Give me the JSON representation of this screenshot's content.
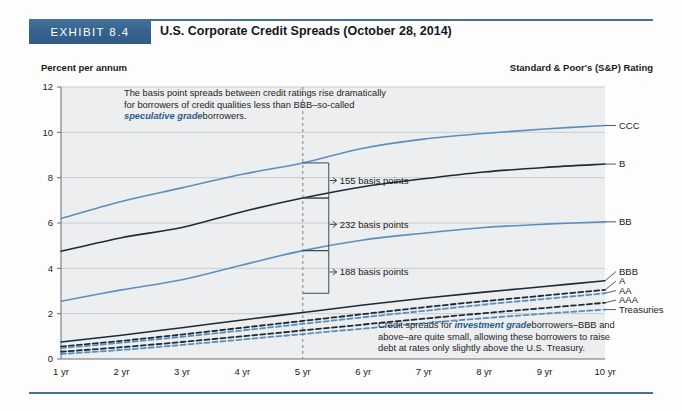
{
  "header": {
    "exhibit_badge": "EXHIBIT 8.4",
    "title": "U.S. Corporate Credit Spreads (October 28, 2014)"
  },
  "captions": {
    "left": "Percent per annum",
    "right": "Standard & Poor's (S&P) Rating"
  },
  "annotations": {
    "top": {
      "line1": "The basis point spreads between credit ratings rise dramatically",
      "line2": "for borrowers of credit qualities less than BBB–so-called",
      "emphasis": "speculative grade",
      "line3_tail": "borrowers."
    },
    "bottom": {
      "lead": "Credit spreads for",
      "emphasis": "investment grade",
      "line1_tail": "borrowers–BBB and",
      "line2": "above–are quite small, allowing these borrowers to raise",
      "line3": "debt at rates only slightly above the U.S. Treasury."
    }
  },
  "callouts": [
    {
      "id": "callout-155",
      "label": "155 basis points",
      "x_year": 5,
      "from": 7.1,
      "to": 8.65
    },
    {
      "id": "callout-232",
      "label": "232 basis points",
      "x_year": 5,
      "from": 4.78,
      "to": 7.1
    },
    {
      "id": "callout-188",
      "label": "188 basis points",
      "x_year": 5,
      "from": 2.9,
      "to": 4.78
    }
  ],
  "marker": {
    "name": "five-year-marker",
    "x_year": 5
  },
  "colors": {
    "banner": "#37648f",
    "rule": "#4a7099",
    "blue_series": "#5b8fc0",
    "dark_series": "#1c2b3a",
    "accent_text": "#2b5c8a",
    "grid": "#c8cdd2",
    "plot_bg": "#eceeef"
  },
  "chart_data": {
    "type": "line",
    "title": "U.S. Corporate Credit Spreads (October 28, 2014)",
    "xlabel": "",
    "ylabel": "Percent per annum",
    "ylim": [
      0,
      12
    ],
    "yticks": [
      0,
      2,
      4,
      6,
      8,
      10,
      12
    ],
    "grid": true,
    "legend_position": "right-endpoint-labels",
    "x": [
      1,
      2,
      3,
      4,
      5,
      6,
      7,
      8,
      9,
      10
    ],
    "categories": [
      "1 yr",
      "2 yr",
      "3 yr",
      "4 yr",
      "5 yr",
      "6 yr",
      "7 yr",
      "8 yr",
      "9 yr",
      "10 yr"
    ],
    "series": [
      {
        "name": "CCC",
        "style": "solid",
        "color": "#5b8fc0",
        "values": [
          6.2,
          6.95,
          7.55,
          8.15,
          8.65,
          9.3,
          9.7,
          9.95,
          10.15,
          10.3
        ]
      },
      {
        "name": "B",
        "style": "solid",
        "color": "#1c2b3a",
        "values": [
          4.75,
          5.35,
          5.8,
          6.5,
          7.1,
          7.6,
          7.95,
          8.25,
          8.45,
          8.6
        ]
      },
      {
        "name": "BB",
        "style": "solid",
        "color": "#5b8fc0",
        "values": [
          2.55,
          3.05,
          3.5,
          4.15,
          4.78,
          5.25,
          5.55,
          5.8,
          5.95,
          6.05
        ]
      },
      {
        "name": "BBB",
        "style": "solid",
        "color": "#1c2b3a",
        "values": [
          0.75,
          1.05,
          1.38,
          1.72,
          2.05,
          2.38,
          2.68,
          2.95,
          3.2,
          3.45
        ]
      },
      {
        "name": "A",
        "style": "dashed",
        "color": "#1c2b3a",
        "values": [
          0.55,
          0.8,
          1.08,
          1.38,
          1.68,
          1.98,
          2.28,
          2.55,
          2.8,
          3.05
        ]
      },
      {
        "name": "AA",
        "style": "dashed",
        "color": "#5b8fc0",
        "values": [
          0.48,
          0.72,
          0.98,
          1.26,
          1.55,
          1.84,
          2.12,
          2.4,
          2.65,
          2.9
        ]
      },
      {
        "name": "AAA",
        "style": "dashed",
        "color": "#1c2b3a",
        "values": [
          0.32,
          0.52,
          0.75,
          1.0,
          1.26,
          1.52,
          1.78,
          2.02,
          2.25,
          2.48
        ]
      },
      {
        "name": "Treasuries",
        "style": "dashed",
        "color": "#5b8fc0",
        "values": [
          0.22,
          0.4,
          0.62,
          0.86,
          1.1,
          1.34,
          1.58,
          1.8,
          2.0,
          2.18
        ]
      }
    ],
    "endpoint_labels": [
      "CCC",
      "B",
      "BB",
      "BBB",
      "A",
      "AA",
      "AAA",
      "Treasuries"
    ]
  }
}
